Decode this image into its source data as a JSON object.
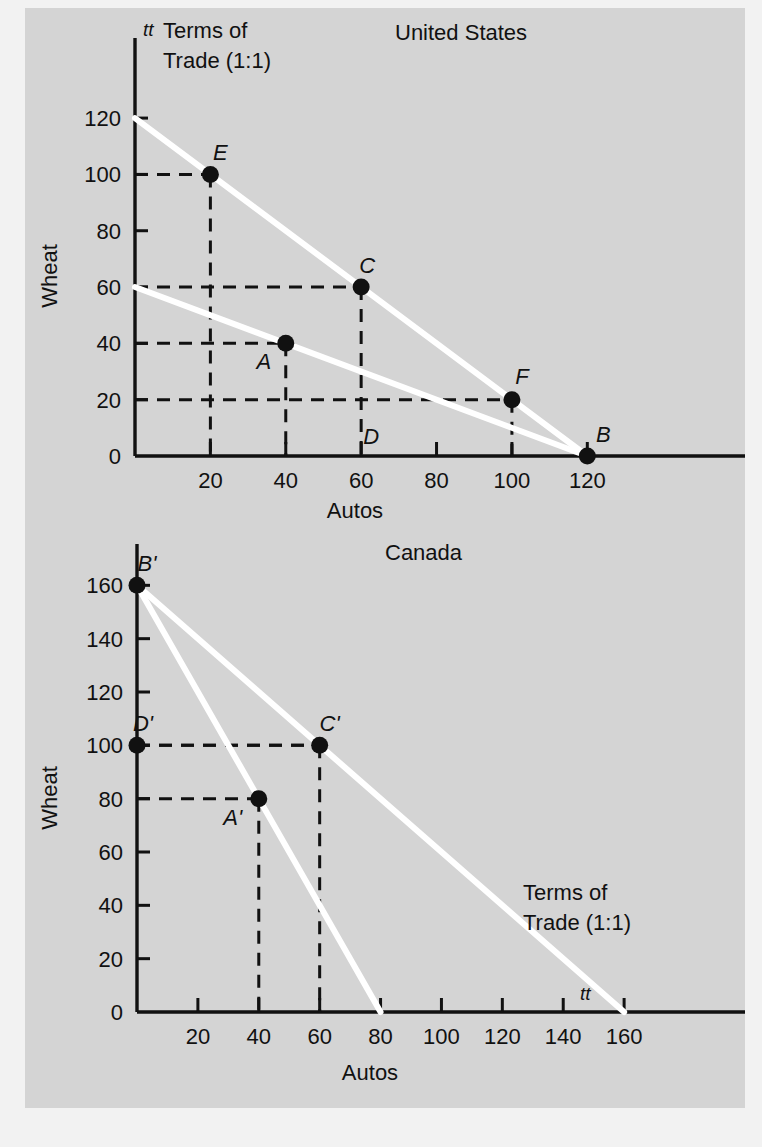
{
  "figure": {
    "background_color": "#d4d4d4",
    "line_color": "#ffffff",
    "ink_color": "#111111"
  },
  "charts": [
    {
      "id": "united-states",
      "title": "United States",
      "xlabel": "Autos",
      "ylabel": "Wheat",
      "xticks": [
        20,
        40,
        60,
        80,
        100,
        120
      ],
      "yticks": [
        0,
        20,
        40,
        60,
        80,
        100,
        120
      ],
      "xlim": [
        0,
        130
      ],
      "ylim": [
        0,
        125
      ],
      "tt_label": "tt",
      "terms_line1": "Terms of",
      "terms_line2": "Trade (1:1)",
      "lines": [
        {
          "name": "ppf",
          "from": [
            0,
            60
          ],
          "to": [
            120,
            0
          ]
        },
        {
          "name": "terms-of-trade",
          "from": [
            0,
            120
          ],
          "to": [
            120,
            0
          ]
        }
      ],
      "points": [
        {
          "label": "A",
          "x": 40,
          "y": 40,
          "dot": true,
          "lx": -22,
          "ly": 26
        },
        {
          "label": "B",
          "x": 120,
          "y": 0,
          "dot": true,
          "lx": 16,
          "ly": -14
        },
        {
          "label": "C",
          "x": 60,
          "y": 60,
          "dot": true,
          "lx": 6,
          "ly": -14
        },
        {
          "label": "D",
          "x": 60,
          "y": 0,
          "dot": false,
          "lx": 10,
          "ly": -12
        },
        {
          "label": "E",
          "x": 20,
          "y": 100,
          "dot": true,
          "lx": 10,
          "ly": -14
        },
        {
          "label": "F",
          "x": 100,
          "y": 20,
          "dot": true,
          "lx": 10,
          "ly": -16
        }
      ]
    },
    {
      "id": "canada",
      "title": "Canada",
      "xlabel": "Autos",
      "ylabel": "Wheat",
      "xticks": [
        20,
        40,
        60,
        80,
        100,
        120,
        140,
        160
      ],
      "yticks": [
        0,
        20,
        40,
        60,
        80,
        100,
        120,
        140,
        160
      ],
      "xlim": [
        0,
        180
      ],
      "ylim": [
        0,
        168
      ],
      "tt_label": "tt",
      "terms_line1": "Terms of",
      "terms_line2": "Trade (1:1)",
      "lines": [
        {
          "name": "ppf",
          "from": [
            0,
            160
          ],
          "to": [
            80,
            0
          ]
        },
        {
          "name": "terms-of-trade",
          "from": [
            0,
            160
          ],
          "to": [
            160,
            0
          ]
        }
      ],
      "points": [
        {
          "label": "A'",
          "x": 40,
          "y": 80,
          "dot": true,
          "lx": -26,
          "ly": 26
        },
        {
          "label": "B'",
          "x": 0,
          "y": 160,
          "dot": true,
          "lx": 10,
          "ly": -14
        },
        {
          "label": "C'",
          "x": 60,
          "y": 100,
          "dot": true,
          "lx": 10,
          "ly": -14
        },
        {
          "label": "D'",
          "x": 0,
          "y": 100,
          "dot": true,
          "lx": 6,
          "ly": -14
        }
      ]
    }
  ],
  "chart_data": [
    {
      "type": "line",
      "title": "United States",
      "xlabel": "Autos",
      "ylabel": "Wheat",
      "xlim": [
        0,
        130
      ],
      "ylim": [
        0,
        125
      ],
      "xticks": [
        20,
        40,
        60,
        80,
        100,
        120
      ],
      "yticks": [
        0,
        20,
        40,
        60,
        80,
        100,
        120
      ],
      "grid": false,
      "legend": "none",
      "series": [
        {
          "name": "Production Possibilities Frontier",
          "x": [
            0,
            120
          ],
          "values": [
            60,
            0
          ]
        },
        {
          "name": "Terms of Trade (1:1) line tt",
          "x": [
            0,
            120
          ],
          "values": [
            120,
            0
          ]
        }
      ],
      "annotations": [
        {
          "label": "A",
          "x": 40,
          "y": 40,
          "note": "pre-trade production/consumption point"
        },
        {
          "label": "B",
          "x": 120,
          "y": 0,
          "note": "specialization point on autos axis"
        },
        {
          "label": "C",
          "x": 60,
          "y": 60,
          "note": "post-trade consumption point on tt line"
        },
        {
          "label": "D",
          "x": 60,
          "y": 0,
          "note": "axis reference for C"
        },
        {
          "label": "E",
          "x": 20,
          "y": 100,
          "note": "point on tt line"
        },
        {
          "label": "F",
          "x": 100,
          "y": 20,
          "note": "point on PPF"
        },
        {
          "label": "tt",
          "x": 0,
          "y": 120,
          "note": "terms of trade line label"
        },
        {
          "label": "Terms of Trade (1:1)",
          "x": 18,
          "y": 118,
          "note": "text annotation"
        }
      ]
    },
    {
      "type": "line",
      "title": "Canada",
      "xlabel": "Autos",
      "ylabel": "Wheat",
      "xlim": [
        0,
        180
      ],
      "ylim": [
        0,
        168
      ],
      "xticks": [
        20,
        40,
        60,
        80,
        100,
        120,
        140,
        160
      ],
      "yticks": [
        0,
        20,
        40,
        60,
        80,
        100,
        120,
        140,
        160
      ],
      "grid": false,
      "legend": "none",
      "series": [
        {
          "name": "Production Possibilities Frontier",
          "x": [
            0,
            80
          ],
          "values": [
            160,
            0
          ]
        },
        {
          "name": "Terms of Trade (1:1) line tt",
          "x": [
            0,
            160
          ],
          "values": [
            160,
            0
          ]
        }
      ],
      "annotations": [
        {
          "label": "A'",
          "x": 40,
          "y": 80,
          "note": "pre-trade production/consumption point"
        },
        {
          "label": "B'",
          "x": 0,
          "y": 160,
          "note": "specialization point on wheat axis"
        },
        {
          "label": "C'",
          "x": 60,
          "y": 100,
          "note": "post-trade consumption point on tt line"
        },
        {
          "label": "D'",
          "x": 0,
          "y": 100,
          "note": "axis reference for C'"
        },
        {
          "label": "tt",
          "x": 160,
          "y": 0,
          "note": "terms of trade line label"
        },
        {
          "label": "Terms of Trade (1:1)",
          "x": 130,
          "y": 38,
          "note": "text annotation"
        }
      ]
    }
  ]
}
